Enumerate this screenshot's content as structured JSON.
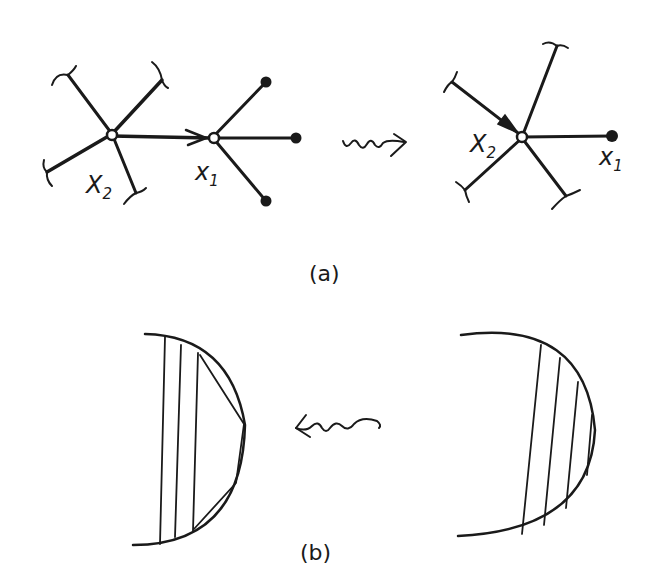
{
  "figure": {
    "panel_a": {
      "caption": "(a)",
      "left_graph": {
        "node_x2_label": "X",
        "node_x2_sub": "2",
        "node_x1_label": "x",
        "node_x1_sub": "1"
      },
      "transform_arrow": "squiggly-right-arrow",
      "right_graph": {
        "node_x2_label": "X",
        "node_x2_sub": "2",
        "node_x1_label": "x",
        "node_x1_sub": "1"
      }
    },
    "panel_b": {
      "caption": "(b)",
      "transform_arrow": "squiggly-left-arrow",
      "left_shape": "half-disk-with-vertical-chords-and-polygonal-cut",
      "right_shape": "half-disk-with-slanted-chords"
    },
    "colors": {
      "ink": "#1a1a1a",
      "background": "#ffffff"
    }
  }
}
